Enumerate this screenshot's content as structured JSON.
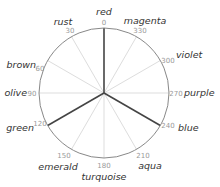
{
  "diagram": {
    "type": "hue-wheel",
    "center": [
      104,
      93
    ],
    "radius": 65,
    "circle_color": "#888888",
    "spoke_color": "#dddddd",
    "highlight_color": "#444444",
    "highlighted_hues": [
      0,
      120,
      240
    ],
    "hues": [
      {
        "deg": 0,
        "deg_label": "0",
        "name": "red"
      },
      {
        "deg": 30,
        "deg_label": "30",
        "name": "rust"
      },
      {
        "deg": 60,
        "deg_label": "60",
        "name": "brown"
      },
      {
        "deg": 90,
        "deg_label": "90",
        "name": "olive"
      },
      {
        "deg": 120,
        "deg_label": "120",
        "name": "green"
      },
      {
        "deg": 150,
        "deg_label": "150",
        "name": "emerald"
      },
      {
        "deg": 180,
        "deg_label": "180",
        "name": "turquoise"
      },
      {
        "deg": 210,
        "deg_label": "210",
        "name": "aqua"
      },
      {
        "deg": 240,
        "deg_label": "240",
        "name": "blue"
      },
      {
        "deg": 270,
        "deg_label": "270",
        "name": "purple"
      },
      {
        "deg": 300,
        "deg_label": "300",
        "name": "violet"
      },
      {
        "deg": 330,
        "deg_label": "330",
        "name": "magenta"
      }
    ]
  }
}
